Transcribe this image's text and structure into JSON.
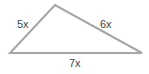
{
  "diagram": {
    "type": "triangle",
    "stroke_color": "#a6a6a6",
    "text_color": "#444444",
    "vertices": {
      "top": [
        55,
        5
      ],
      "bottom_left": [
        10,
        53
      ],
      "bottom_right": [
        142,
        53
      ]
    },
    "sides": [
      {
        "id": "left",
        "label": "5x"
      },
      {
        "id": "right",
        "label": "6x"
      },
      {
        "id": "bottom",
        "label": "7x"
      }
    ]
  }
}
